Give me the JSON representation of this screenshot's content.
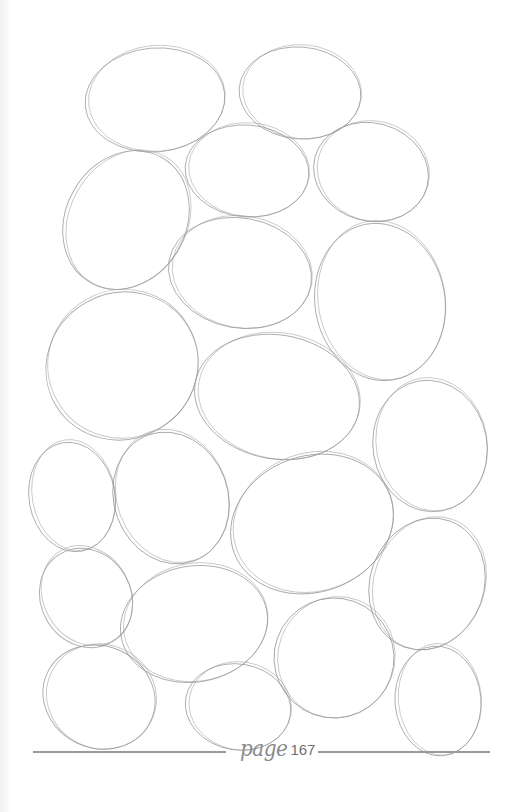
{
  "page": {
    "type": "coloring-book page",
    "motif": "overlapping pencil-sketched ovals",
    "shape_count": 20,
    "line_color": "#9a9a9a",
    "background_color": "#ffffff"
  },
  "footer": {
    "word": "page",
    "number": "167"
  }
}
